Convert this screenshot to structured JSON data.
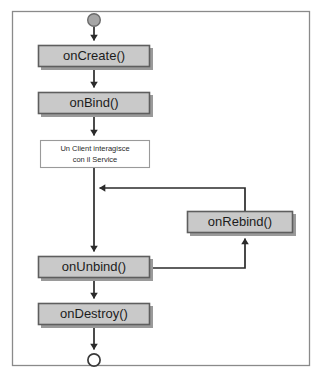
{
  "diagram": {
    "type": "flowchart",
    "frame": {
      "border_color": "#8a8a8a",
      "background": "#ffffff",
      "x": 12,
      "y": 11,
      "width": 298,
      "height": 355
    },
    "colors": {
      "node_fill": "#c9c9c9",
      "node_border": "#5e5e5e",
      "node_shadow": "#9a9a9a",
      "note_fill": "#ffffff",
      "note_border": "#9a9a9a",
      "edge": "#2b2b2b",
      "start_node_fill": "#a6a6a6",
      "start_node_border": "#6b6b6b",
      "end_node_fill": "#ffffff",
      "end_node_border": "#3a3a3a",
      "text": "#1c1c1c"
    },
    "nodes": [
      {
        "id": "start",
        "kind": "start-node",
        "label": "",
        "cx": 94,
        "cy": 20,
        "r": 6.5
      },
      {
        "id": "on-create",
        "kind": "process-box",
        "label": "onCreate()",
        "x": 38,
        "y": 45,
        "width": 112,
        "height": 22
      },
      {
        "id": "on-bind",
        "kind": "process-box",
        "label": "onBind()",
        "x": 38,
        "y": 92,
        "width": 112,
        "height": 22
      },
      {
        "id": "client-note",
        "kind": "note-box",
        "label_line1": "Un Client interagisce",
        "label_line2": "con il Service",
        "x": 40,
        "y": 140,
        "width": 110,
        "height": 28
      },
      {
        "id": "on-rebind",
        "kind": "process-box",
        "label": "onRebind()",
        "x": 187,
        "y": 211,
        "width": 106,
        "height": 22
      },
      {
        "id": "on-unbind",
        "kind": "process-box",
        "label": "onUnbind()",
        "x": 38,
        "y": 256,
        "width": 112,
        "height": 22
      },
      {
        "id": "on-destroy",
        "kind": "process-box",
        "label": "onDestroy()",
        "x": 38,
        "y": 303,
        "width": 112,
        "height": 22
      },
      {
        "id": "end",
        "kind": "end-node",
        "label": "",
        "cx": 94,
        "cy": 360,
        "r": 6.5
      }
    ],
    "edges": [
      {
        "id": "start-to-oncreate",
        "from": "start",
        "to": "on-create",
        "arrowhead": "down"
      },
      {
        "id": "oncreate-to-onbind",
        "from": "on-create",
        "to": "on-bind",
        "arrowhead": "down"
      },
      {
        "id": "onbind-to-note",
        "from": "on-bind",
        "to": "client-note",
        "arrowhead": "down"
      },
      {
        "id": "note-to-onunbind",
        "from": "client-note",
        "to": "on-unbind",
        "arrowhead": "down"
      },
      {
        "id": "onunbind-to-onrebind",
        "from": "on-unbind",
        "to": "on-rebind",
        "arrowhead": "up"
      },
      {
        "id": "onrebind-to-spine",
        "from": "on-rebind",
        "to": "spine",
        "arrowhead": "left"
      },
      {
        "id": "onunbind-to-ondestroy",
        "from": "on-unbind",
        "to": "on-destroy",
        "arrowhead": "down"
      },
      {
        "id": "ondestroy-to-end",
        "from": "on-destroy",
        "to": "end",
        "arrowhead": "down"
      }
    ]
  }
}
